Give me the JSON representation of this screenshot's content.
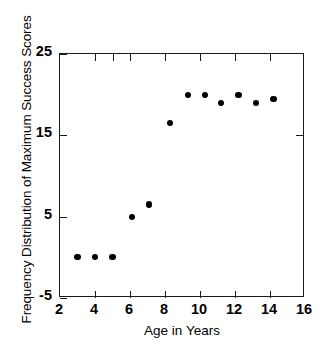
{
  "chart_data": {
    "type": "scatter",
    "title": "",
    "xlabel": "Age in Years",
    "ylabel": "Frequency Distribution of Maximum Success Scores",
    "xlim": [
      2,
      16
    ],
    "ylim": [
      -5,
      25
    ],
    "xticks": [
      2,
      4,
      6,
      8,
      10,
      12,
      14,
      16
    ],
    "yticks": [
      -5,
      5,
      15,
      25
    ],
    "xtick_labels": [
      "2",
      "4",
      "6",
      "8",
      "10",
      "12",
      "14",
      "16"
    ],
    "ytick_labels": [
      "-5",
      "5",
      "15",
      "25"
    ],
    "grid": false,
    "legend": null,
    "marker": "filled-circle",
    "marker_color": "#000000",
    "x": [
      3.0,
      4.0,
      5.0,
      6.1,
      7.1,
      8.3,
      9.3,
      10.3,
      11.2,
      12.2,
      13.2,
      14.2
    ],
    "y": [
      0.0,
      0.0,
      0.0,
      5.0,
      6.5,
      16.5,
      20.0,
      20.0,
      19.0,
      20.0,
      19.0,
      19.5
    ],
    "points": [
      {
        "x": 3.0,
        "y": 0.0
      },
      {
        "x": 4.0,
        "y": 0.0
      },
      {
        "x": 5.0,
        "y": 0.0
      },
      {
        "x": 6.1,
        "y": 5.0
      },
      {
        "x": 7.1,
        "y": 6.5
      },
      {
        "x": 8.3,
        "y": 16.5
      },
      {
        "x": 9.3,
        "y": 20.0
      },
      {
        "x": 10.3,
        "y": 20.0
      },
      {
        "x": 11.2,
        "y": 19.0
      },
      {
        "x": 12.2,
        "y": 20.0
      },
      {
        "x": 13.2,
        "y": 19.0
      },
      {
        "x": 14.2,
        "y": 19.5
      }
    ]
  },
  "axes": {
    "y_title": "Frequency Distribution of Maximum Success Scores",
    "x_title": "Age in Years"
  }
}
